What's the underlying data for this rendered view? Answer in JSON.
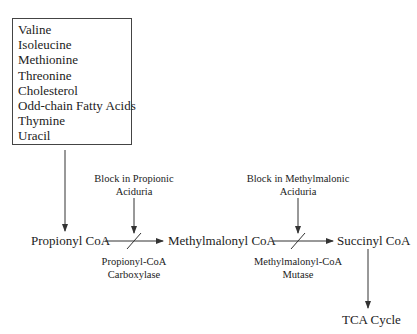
{
  "sources_box": {
    "items": [
      "Valine",
      "Isoleucine",
      "Methionine",
      "Threonine",
      "Cholesterol",
      "Odd-chain Fatty Acids",
      "Thymine",
      "Uracil"
    ]
  },
  "nodes": {
    "propionyl": "Propionyl CoA",
    "methylmalonyl": "Methylmalonyl CoA",
    "succinyl": "Succinyl CoA",
    "tca": "TCA Cycle"
  },
  "blocks": {
    "propionic_line1": "Block in Propionic",
    "propionic_line2": "Aciduria",
    "methylmalonic_line1": "Block in Methylmalonic",
    "methylmalonic_line2": "Aciduria"
  },
  "enzymes": {
    "carboxylase_line1": "Propionyl-CoA",
    "carboxylase_line2": "Carboxylase",
    "mutase_line1": "Methylmalonyl-CoA",
    "mutase_line2": "Mutase"
  }
}
